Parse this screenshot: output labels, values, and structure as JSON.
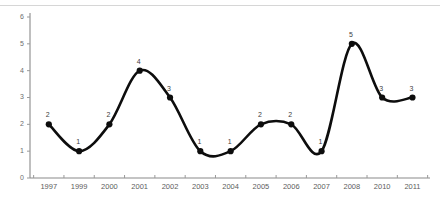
{
  "chart_data": {
    "type": "line",
    "title": "",
    "subtitle": "",
    "xlabel": "",
    "ylabel": "",
    "categories": [
      "1997",
      "1999",
      "2000",
      "2001",
      "2002",
      "2003",
      "2004",
      "2005",
      "2006",
      "2007",
      "2008",
      "2010",
      "2011"
    ],
    "values": [
      2,
      1,
      2,
      4,
      3,
      1,
      1,
      2,
      2,
      1,
      5,
      3,
      3
    ],
    "point_labels": [
      "2",
      "1",
      "2",
      "4",
      "3",
      "1",
      "1",
      "2",
      "2",
      "1",
      "5",
      "3",
      "3"
    ],
    "ylim": [
      0,
      6
    ],
    "yticks": [
      0,
      1,
      2,
      3,
      4,
      5,
      6
    ],
    "ytick_labels": [
      "0",
      "1",
      "2",
      "3",
      "4",
      "5",
      "6"
    ],
    "grid": false,
    "legend": false,
    "legend_position": "none",
    "series": [
      {
        "name": "",
        "values": [
          2,
          1,
          2,
          4,
          3,
          1,
          1,
          2,
          2,
          1,
          5,
          3,
          3
        ],
        "color": "#0d0d0d",
        "marker": "circle",
        "smooth": true
      }
    ],
    "colors": {
      "line": "#0d0d0d",
      "marker": "#0d0d0d",
      "axis": "#8a8a8a",
      "tick_label": "#5d5d5d",
      "point_label": "#3d3d3d",
      "top_rule": "#d6d6d6",
      "background": "#ffffff"
    }
  }
}
